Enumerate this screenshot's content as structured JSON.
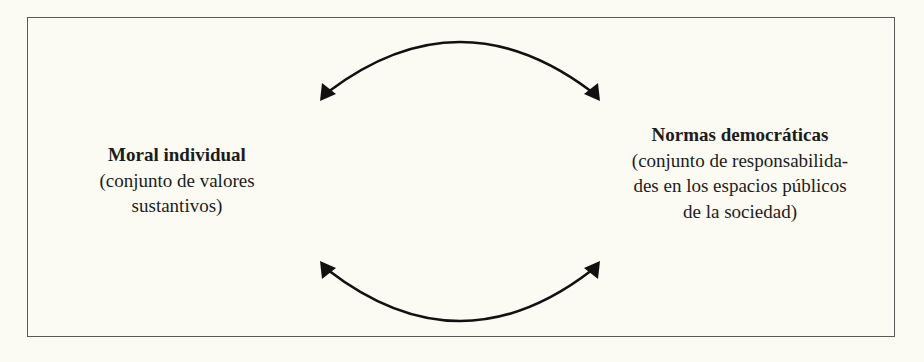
{
  "diagram": {
    "colors": {
      "background": "#fbfaf3",
      "border": "#5a5a58",
      "text": "#1c1c1c",
      "arrow": "#111111"
    },
    "nodes": [
      {
        "id": "moral-individual",
        "title": "Moral individual",
        "description_lines": [
          "(conjunto de valores",
          "sustantivos)"
        ]
      },
      {
        "id": "normas-democraticas",
        "title": "Normas democráticas",
        "description_lines": [
          "(conjunto de responsabilida-",
          "des en los espacios públicos",
          "de la sociedad)"
        ]
      }
    ],
    "edges": [
      {
        "id": "top-arc",
        "type": "bidirectional-curved-arrow",
        "from": "moral-individual",
        "to": "normas-democraticas",
        "position": "top"
      },
      {
        "id": "bottom-arc",
        "type": "bidirectional-curved-arrow",
        "from": "moral-individual",
        "to": "normas-democraticas",
        "position": "bottom"
      }
    ]
  }
}
